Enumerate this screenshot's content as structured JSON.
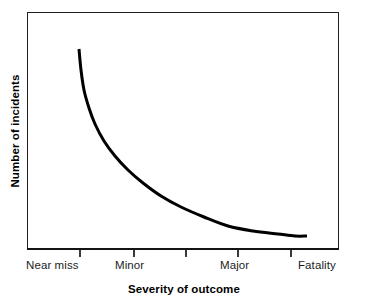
{
  "chart_data": {
    "type": "line",
    "title": "",
    "subtitle": "",
    "xlabel": "Severity of outcome",
    "ylabel": "Number of incidents",
    "grid": false,
    "legend": null,
    "annotations": [],
    "xlim": [
      0,
      6
    ],
    "ylim": [
      0,
      100
    ],
    "x_tick_positions": [
      1,
      2,
      3,
      4,
      5
    ],
    "x_tick_labels_shown": [
      "Near miss",
      "Minor",
      "Major",
      "Fatality"
    ],
    "x_category_labels": [
      {
        "label": "Near miss",
        "align": "left",
        "x_px": 27
      },
      {
        "label": "Minor",
        "align": "center",
        "x_px": 133
      },
      {
        "label": "Major",
        "align": "center",
        "x_px": 238
      },
      {
        "label": "Fatality",
        "align": "right",
        "x_px": 339
      }
    ],
    "series": [
      {
        "name": "Incidents by severity",
        "color": "#000000",
        "line_width_px": 3,
        "x": [
          1.0,
          1.1,
          1.25,
          1.45,
          1.7,
          2.0,
          2.35,
          2.75,
          3.2,
          3.7,
          4.25,
          4.85,
          5.25
        ],
        "y": [
          84.0,
          62.0,
          48.0,
          38.5,
          31.0,
          25.0,
          20.0,
          16.0,
          12.5,
          9.5,
          7.0,
          5.5,
          5.0
        ]
      }
    ],
    "curve_points_px": [
      [
        79,
        49
      ],
      [
        81,
        70
      ],
      [
        84,
        90
      ],
      [
        89,
        108
      ],
      [
        95,
        124
      ],
      [
        104,
        141
      ],
      [
        115,
        156
      ],
      [
        128,
        170
      ],
      [
        143,
        183
      ],
      [
        161,
        196
      ],
      [
        181,
        207
      ],
      [
        204,
        217
      ],
      [
        228,
        226
      ],
      [
        253,
        231
      ],
      [
        278,
        234
      ],
      [
        295,
        236
      ],
      [
        307,
        236
      ]
    ],
    "ticks_px": [
      79,
      133,
      185,
      237,
      290
    ],
    "plot_frame_px": {
      "left": 27,
      "top": 12,
      "right": 339,
      "bottom": 250
    },
    "colors": {
      "curve": "#000000",
      "frame": "#231f20",
      "axis": "#141414",
      "tick": "#3a3a3a",
      "text": "#000000",
      "background": "#ffffff"
    }
  },
  "axes": {
    "y_title": "Number of incidents",
    "x_title": "Severity of outcome"
  },
  "x_labels": {
    "near_miss": "Near miss",
    "minor": "Minor",
    "major": "Major",
    "fatality": "Fatality"
  }
}
